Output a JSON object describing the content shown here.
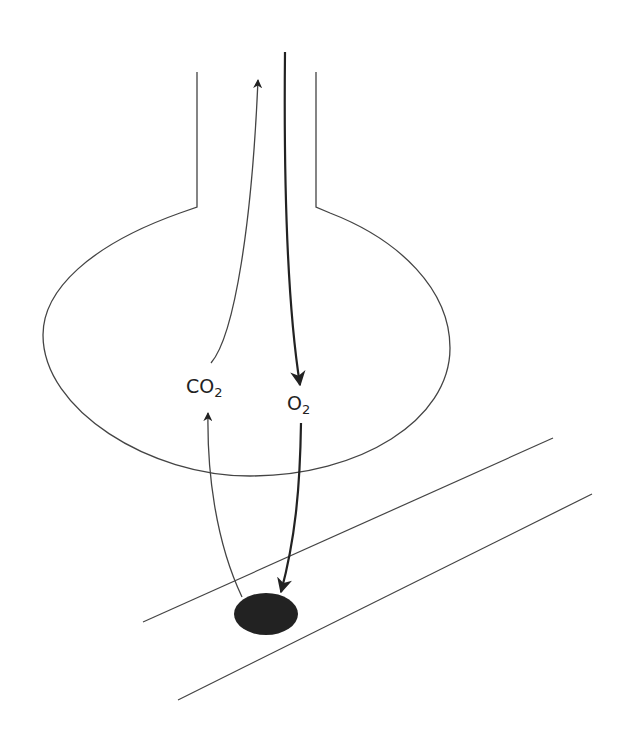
{
  "diagram": {
    "labels": {
      "co2": {
        "main": "CO",
        "sub": "2"
      },
      "o2": {
        "main": "O",
        "sub": "2"
      }
    },
    "colors": {
      "stroke": "#333333",
      "cell": "#222222",
      "background": "#ffffff"
    },
    "parts": [
      "airway",
      "alveolus",
      "capillary",
      "red-blood-cell",
      "co2-arrows",
      "o2-arrows"
    ]
  }
}
